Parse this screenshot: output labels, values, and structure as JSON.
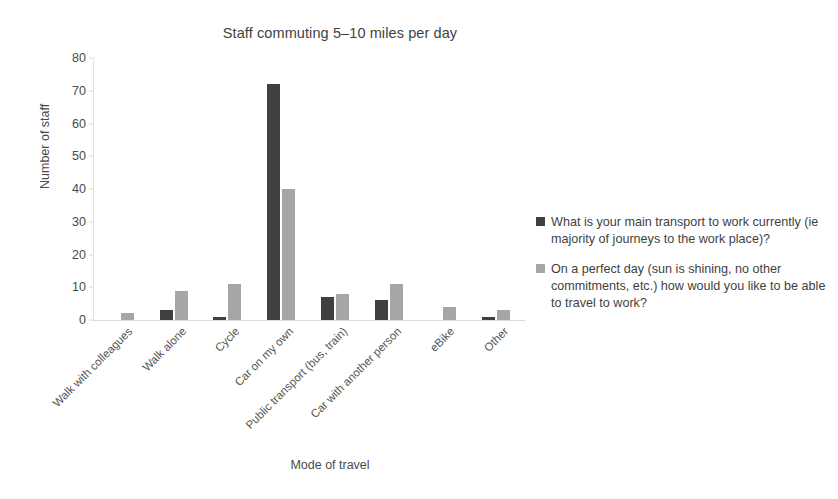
{
  "chart_data": {
    "type": "bar",
    "title": "Staff commuting 5–10 miles per day",
    "xlabel": "Mode of travel",
    "ylabel": "Number of staff",
    "ylim": [
      0,
      80
    ],
    "yticks": [
      0,
      10,
      20,
      30,
      40,
      50,
      60,
      70,
      80
    ],
    "grid": false,
    "legend_position": "right",
    "categories": [
      "Walk with colleagues",
      "Walk alone",
      "Cycle",
      "Car on my own",
      "Public transport (bus, train)",
      "Car with another person",
      "eBike",
      "Other"
    ],
    "series": [
      {
        "name": "What is your main transport to work currently (ie majority of journeys to the work place)?",
        "color": "#404040",
        "values": [
          0,
          3,
          1,
          72,
          7,
          6,
          0,
          1
        ]
      },
      {
        "name": "On a perfect day (sun is shining, no other commitments, etc.) how would you like to be able to travel to work?",
        "color": "#a6a6a6",
        "values": [
          2,
          9,
          11,
          40,
          8,
          11,
          4,
          3
        ]
      }
    ]
  }
}
